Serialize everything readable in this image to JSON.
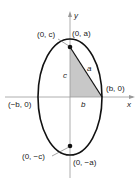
{
  "diagram": {
    "type": "ellipse-foci",
    "axes": {
      "x_label": "x",
      "y_label": "y"
    },
    "points": {
      "top_vertex": "(0, a)",
      "bottom_vertex": "(0, −a)",
      "top_focus": "(0, c)",
      "bottom_focus": "(0, −c)",
      "right_covertex": "(b, 0)",
      "left_covertex": "(−b, 0)"
    },
    "segments": {
      "hypotenuse": "a",
      "vertical_leg": "c",
      "horizontal_leg": "b"
    },
    "colors": {
      "ellipse": "#111111",
      "axes": "#888888",
      "triangle_fill": "#c8c8c8"
    }
  }
}
